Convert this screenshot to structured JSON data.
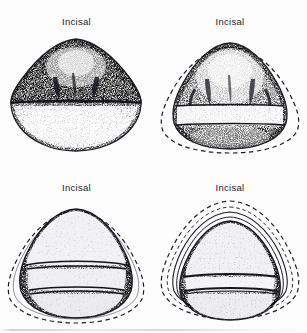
{
  "page": {
    "background_color": "#fdfdfd",
    "ink_color": "#1b1b26",
    "width": 307,
    "height": 333
  },
  "figures": [
    {
      "id": "figure-top-left",
      "label": "Incisal",
      "position": "top-left",
      "description": "Stippled incisal view of tooth crown, triangular-rounded outline, no dashed outline",
      "has_dashed_outline": false,
      "inner_bands": 1
    },
    {
      "id": "figure-top-right",
      "label": "Incisal",
      "position": "top-right",
      "description": "Stippled incisal view of tooth crown with dashed outer reference outline and horizontal light band",
      "has_dashed_outline": true,
      "inner_bands": 2
    },
    {
      "id": "figure-bottom-left",
      "label": "Incisal",
      "position": "bottom-left",
      "description": "Stippled incisal view with dashed outer outline and two stacked horizontal bands",
      "has_dashed_outline": true,
      "inner_bands": 3
    },
    {
      "id": "figure-bottom-right",
      "label": "Incisal",
      "position": "bottom-right",
      "description": "Stippled incisal view with multiple concentric dashed and solid contour rings and one horizontal band",
      "has_dashed_outline": true,
      "inner_bands": 2
    }
  ]
}
